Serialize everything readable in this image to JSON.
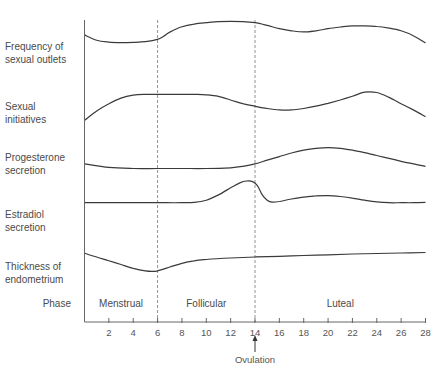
{
  "chart_data": {
    "type": "line",
    "title": "",
    "xlabel": "",
    "ylabel": "",
    "xlim": [
      0,
      28
    ],
    "x_ticks": [
      2,
      4,
      6,
      8,
      10,
      12,
      14,
      16,
      18,
      20,
      22,
      24,
      26,
      28
    ],
    "grid": false,
    "legend": "none (row labels at left)",
    "dividers": [
      6,
      14
    ],
    "rows": [
      {
        "label_lines": [
          "Frequency of",
          "sexual outlets"
        ],
        "note": "relative level 0 (low) to 1 (high)",
        "x": [
          0,
          1,
          2,
          3,
          4,
          5,
          6,
          6.5,
          7,
          8,
          9,
          10,
          11,
          12,
          13,
          14,
          15,
          16,
          17,
          18,
          19,
          20,
          21,
          22,
          23,
          24,
          25,
          26,
          27,
          28
        ],
        "y": [
          0.45,
          0.25,
          0.18,
          0.16,
          0.17,
          0.2,
          0.28,
          0.4,
          0.55,
          0.75,
          0.85,
          0.9,
          0.94,
          0.95,
          0.94,
          0.9,
          0.8,
          0.68,
          0.6,
          0.56,
          0.6,
          0.68,
          0.74,
          0.78,
          0.78,
          0.76,
          0.7,
          0.6,
          0.42,
          0.15
        ]
      },
      {
        "label_lines": [
          "Sexual",
          "initiatives"
        ],
        "x": [
          0,
          1,
          2,
          3,
          4,
          5,
          6,
          7,
          8,
          9,
          10,
          11,
          12,
          13,
          14,
          15,
          16,
          17,
          18,
          19,
          20,
          21,
          22,
          23,
          24,
          25,
          26,
          27,
          28
        ],
        "y": [
          0.1,
          0.35,
          0.55,
          0.7,
          0.78,
          0.8,
          0.8,
          0.8,
          0.8,
          0.8,
          0.79,
          0.75,
          0.65,
          0.55,
          0.48,
          0.42,
          0.38,
          0.38,
          0.42,
          0.48,
          0.56,
          0.65,
          0.75,
          0.86,
          0.85,
          0.72,
          0.55,
          0.38,
          0.2
        ]
      },
      {
        "label_lines": [
          "Progesterone",
          "secretion"
        ],
        "x": [
          0,
          2,
          4,
          6,
          8,
          10,
          12,
          13,
          14,
          15,
          16,
          17,
          18,
          19,
          20,
          21,
          22,
          23,
          24,
          25,
          26,
          27,
          28
        ],
        "y": [
          0.45,
          0.35,
          0.32,
          0.32,
          0.32,
          0.32,
          0.34,
          0.38,
          0.45,
          0.55,
          0.65,
          0.75,
          0.83,
          0.88,
          0.9,
          0.88,
          0.83,
          0.76,
          0.68,
          0.6,
          0.52,
          0.45,
          0.38
        ]
      },
      {
        "label_lines": [
          "Estradiol",
          "secretion"
        ],
        "x": [
          0,
          2,
          4,
          6,
          8,
          9,
          10,
          11,
          12,
          12.8,
          13.3,
          13.8,
          14.2,
          14.6,
          15,
          15.4,
          16,
          17,
          18,
          19,
          20,
          21,
          22,
          23,
          24,
          25,
          26,
          27,
          28
        ],
        "y": [
          0.3,
          0.3,
          0.3,
          0.3,
          0.3,
          0.31,
          0.38,
          0.55,
          0.78,
          0.95,
          1.0,
          0.98,
          0.85,
          0.55,
          0.38,
          0.32,
          0.34,
          0.42,
          0.48,
          0.52,
          0.53,
          0.5,
          0.45,
          0.38,
          0.33,
          0.3,
          0.3,
          0.3,
          0.31
        ]
      },
      {
        "label_lines": [
          "Thickness of",
          "endometrium"
        ],
        "x": [
          0,
          1,
          2,
          3,
          4,
          5,
          5.5,
          6,
          7,
          8,
          9,
          10,
          12,
          14,
          16,
          18,
          20,
          22,
          24,
          26,
          28
        ],
        "y": [
          0.75,
          0.6,
          0.45,
          0.3,
          0.15,
          0.05,
          0.03,
          0.05,
          0.2,
          0.35,
          0.45,
          0.5,
          0.56,
          0.6,
          0.63,
          0.66,
          0.69,
          0.72,
          0.74,
          0.76,
          0.78
        ]
      }
    ],
    "phase_row_label": "Phase",
    "phases": [
      {
        "label": "Menstrual",
        "from": 0,
        "to": 6
      },
      {
        "label": "Follicular",
        "from": 6,
        "to": 14
      },
      {
        "label": "Luteal",
        "from": 14,
        "to": 28
      }
    ],
    "annotations": [
      {
        "label": "Ovulation",
        "x": 14,
        "type": "arrow-up"
      }
    ]
  }
}
